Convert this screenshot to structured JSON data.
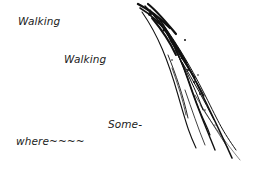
{
  "illustration": {
    "lines": [
      {
        "text": "Walking"
      },
      {
        "text": "Walking"
      },
      {
        "text": "Some-"
      },
      {
        "text": "where~~~~"
      }
    ],
    "graphic": "ink-brush-grass-stroke",
    "colors": {
      "background": "#ffffff",
      "text": "#222222",
      "ink": "#111111"
    }
  }
}
